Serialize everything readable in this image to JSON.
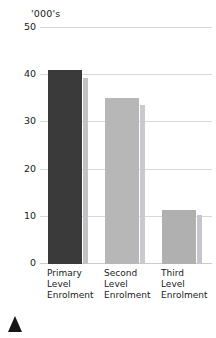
{
  "chart_data": {
    "type": "bar",
    "title": "",
    "unit_caption": "'000's",
    "xlabel": "",
    "ylabel": "'000's",
    "ylim": [
      0,
      50
    ],
    "yticks": [
      0,
      10,
      20,
      30,
      40,
      50
    ],
    "ytick_labels": [
      "0",
      "10",
      "20",
      "30",
      "40",
      "50"
    ],
    "grid": true,
    "legend": "none",
    "categories": [
      "Primary Level Enrolment",
      "Second Level Enrolment",
      "Third Level Enrolment"
    ],
    "category_lines": [
      [
        "Primary",
        "Level",
        "Enrolment"
      ],
      [
        "Second",
        "Level",
        "Enrolment"
      ],
      [
        "Third",
        "Level",
        "Enrolment"
      ]
    ],
    "values": [
      41.0,
      35.2,
      11.4
    ],
    "shadow_values": [
      39.5,
      33.6,
      10.3
    ],
    "bar_colors": [
      "#3a3a3a",
      "#b7b7b7",
      "#b0b0b0"
    ],
    "shadow_colors": [
      "#c0c2c6",
      "#c8cace",
      "#c4c6ca"
    ]
  },
  "marker": {
    "name": "up-triangle-marker",
    "color": "#161616"
  },
  "colors": {
    "gridline": "#d6d8dc",
    "text": "#1a1a1a",
    "background": "#ffffff"
  }
}
